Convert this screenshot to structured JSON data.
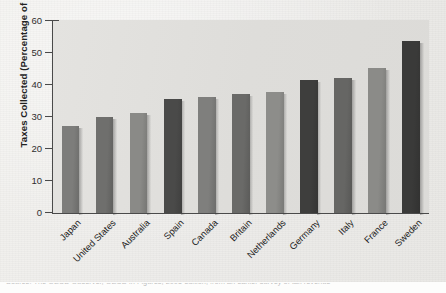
{
  "chart_data": {
    "type": "bar",
    "title": "",
    "subtitle": "",
    "xlabel": "",
    "ylabel": "Taxes Collected (Percentage of GDP)",
    "ylim": [
      0,
      60
    ],
    "yticks": [
      0,
      10,
      20,
      30,
      40,
      50,
      60
    ],
    "grid": false,
    "legend": "none",
    "categories": [
      "Japan",
      "United States",
      "Australia",
      "Spain",
      "Canada",
      "Britain",
      "Netherlands",
      "Germany",
      "Italy",
      "France",
      "Sweden"
    ],
    "values": [
      27,
      30,
      31,
      35.5,
      36,
      37,
      37.5,
      41.5,
      42,
      45,
      53.5
    ],
    "bar_colors": [
      "#7d7d7b",
      "#6f6f6d",
      "#8a8a87",
      "#4a4a49",
      "#7f7f7d",
      "#6a6a68",
      "#8d8d8a",
      "#3e3e3d",
      "#666664",
      "#8b8b88",
      "#3a3a39"
    ]
  },
  "axes": {
    "y_title": "Taxes Collected (Percentage of GDP)",
    "y_tick_labels": [
      "0",
      "10",
      "20",
      "30",
      "40",
      "50",
      "60"
    ]
  },
  "caption": {
    "clipped_line": "Source: The OECD Observer, OECD in Figures, 2005 edition, from an earlier survey of tax revenue"
  },
  "colors": {
    "axis": "#4a4a4a",
    "plot_background": "#dedddA",
    "page_background": "#efeeec",
    "text": "#222222"
  }
}
